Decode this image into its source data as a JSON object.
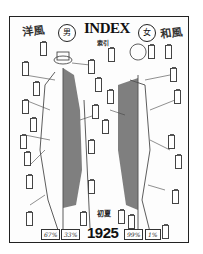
{
  "document": {
    "title": "INDEX",
    "subtitle": "索引",
    "header_left": "洋風",
    "header_right": "和風",
    "male_label": "男",
    "female_label": "女",
    "season": "初夏",
    "year": "1925",
    "male_percentages": [
      "67%",
      "33%"
    ],
    "female_percentages": [
      "99%",
      "1%"
    ]
  },
  "colors": {
    "ink": "#222222",
    "paper": "#ffffff"
  }
}
